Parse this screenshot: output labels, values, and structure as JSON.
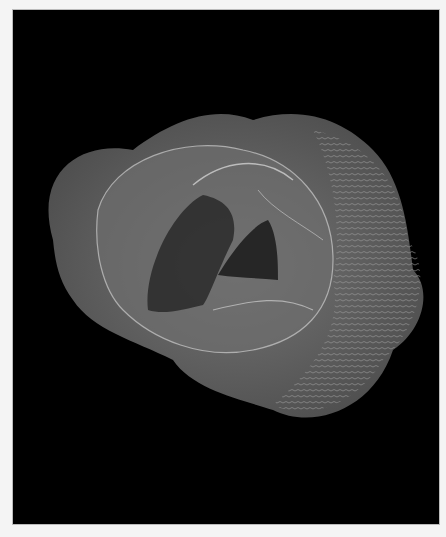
{
  "image": {
    "description": "Abstract 3D parametric surface rendered as translucent gray wireframe on black background",
    "colors": {
      "background": "#000000",
      "border": "#f4f4f4",
      "surface": "#7a7a7a",
      "highlight": "#d8d8d8"
    }
  }
}
